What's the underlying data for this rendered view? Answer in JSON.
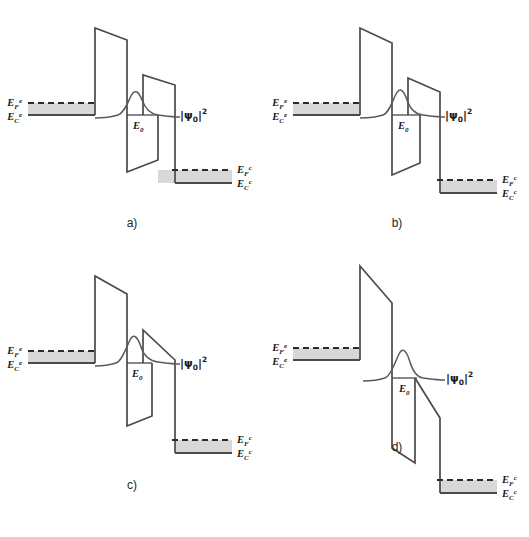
{
  "figure": {
    "title": "",
    "background_color": "#ffffff",
    "line_color": "#4a4a4a",
    "band_fill_color": "#d8d8d8",
    "text_color": "#1a1a1a"
  },
  "labels": {
    "emitter_fermi": "E",
    "emitter_fermi_sub": "F",
    "emitter_fermi_sup": "e",
    "emitter_cond": "E",
    "emitter_cond_sub": "C",
    "emitter_cond_sup": "e",
    "collector_fermi": "E",
    "collector_fermi_sub": "F",
    "collector_fermi_sup": "c",
    "collector_cond": "E",
    "collector_cond_sub": "C",
    "collector_cond_sup": "c",
    "resonant_level": "E",
    "resonant_level_sub": "0",
    "wavefunction": "|ψ",
    "wavefunction_sub": "0",
    "wavefunction_tail": "|",
    "wavefunction_sup": "2"
  },
  "panels": [
    {
      "id": "a",
      "caption": "a)",
      "description": "Zero to small bias: flat emitter and collector, resonant level aligned with emitter conduction band edge",
      "emitter_cond_y": 115,
      "emitter_fermi_y": 103,
      "collector_cond_y": 183,
      "collector_fermi_y": 170,
      "resonant_level_y": 115,
      "barrier1_x": 95,
      "barrier2_x": 158,
      "barrier_top_y": 28,
      "barrier2_top_y": 75,
      "bias_label": "low bias"
    },
    {
      "id": "b",
      "caption": "b)",
      "description": "Increased bias: collector band lowered further, second barrier tilted",
      "emitter_cond_y": 115,
      "emitter_fermi_y": 103,
      "collector_cond_y": 193,
      "collector_fermi_y": 180,
      "resonant_level_y": 115,
      "barrier1_x": 95,
      "barrier2_x": 158,
      "barrier_top_y": 28,
      "barrier2_top_y": 78,
      "bias_label": "medium bias"
    },
    {
      "id": "c",
      "caption": "c)",
      "description": "Resonance condition: resonant level aligned with emitter Fermi sea, second barrier strongly tilted",
      "emitter_cond_y": 115,
      "emitter_fermi_y": 103,
      "collector_cond_y": 205,
      "collector_fermi_y": 192,
      "resonant_level_y": 115,
      "barrier1_x": 95,
      "barrier2_x": 158,
      "barrier_top_y": 28,
      "barrier2_top_y": 82,
      "bias_label": "resonance"
    },
    {
      "id": "d",
      "caption": "d)",
      "description": "High bias beyond resonance: second barrier fully collapsed below resonant level",
      "emitter_cond_y": 112,
      "emitter_fermi_y": 100,
      "collector_cond_y": 245,
      "collector_fermi_y": 232,
      "resonant_level_y": 130,
      "barrier1_x": 95,
      "barrier2_x": 158,
      "barrier_top_y": 18,
      "barrier2_top_y": 130,
      "bias_label": "off resonance"
    }
  ]
}
